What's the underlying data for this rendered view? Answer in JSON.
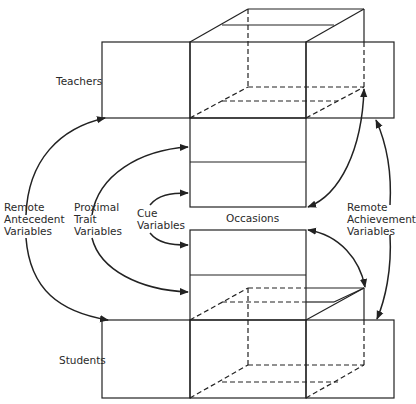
{
  "figure": {
    "type": "lens-model block diagram",
    "line_color": "#222222",
    "background": "#ffffff"
  },
  "labels": {
    "teachers": "Teachers",
    "students": "Students",
    "occasions": "Occasions",
    "remote_antecedent": [
      "Remote",
      "Antecedent",
      "Variables"
    ],
    "proximal_trait": [
      "Proximal",
      "Trait",
      "Variables"
    ],
    "cue": [
      "Cue",
      "Variables"
    ],
    "remote_achievement": [
      "Remote",
      "Achievement",
      "Variables"
    ]
  }
}
